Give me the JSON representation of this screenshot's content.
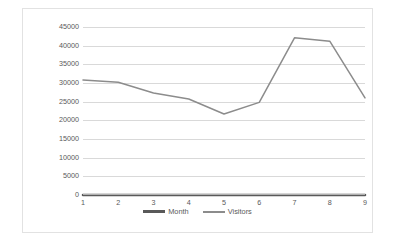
{
  "chart_data": {
    "type": "line",
    "title": "",
    "xlabel": "",
    "ylabel": "",
    "x": [
      1,
      2,
      3,
      4,
      5,
      6,
      7,
      8,
      9
    ],
    "categories": [
      "1",
      "2",
      "3",
      "4",
      "5",
      "6",
      "7",
      "8",
      "9"
    ],
    "series": [
      {
        "name": "Month",
        "values": [
          1,
          2,
          3,
          4,
          5,
          6,
          7,
          8,
          9
        ],
        "color": "#595959"
      },
      {
        "name": "Visitors",
        "values": [
          30800,
          30200,
          27300,
          25700,
          21700,
          24800,
          42100,
          41200,
          26000
        ],
        "color": "#8c8c8c"
      }
    ],
    "ylim": [
      0,
      45000
    ],
    "xlim": [
      1,
      9
    ],
    "yticks": [
      0,
      5000,
      10000,
      15000,
      20000,
      25000,
      30000,
      35000,
      40000,
      45000
    ],
    "ytick_labels": [
      "0",
      "5000",
      "10000",
      "15000",
      "20000",
      "25000",
      "30000",
      "35000",
      "40000",
      "45000"
    ],
    "xtick_labels": [
      "1",
      "2",
      "3",
      "4",
      "5",
      "6",
      "7",
      "8",
      "9"
    ],
    "grid": "horizontal",
    "legend_position": "bottom",
    "legend_entries": [
      "Month",
      "Visitors"
    ],
    "plot_background": "#ffffff",
    "gridline_color": "#d9d9d9",
    "border_color": "#e2e2e2"
  }
}
